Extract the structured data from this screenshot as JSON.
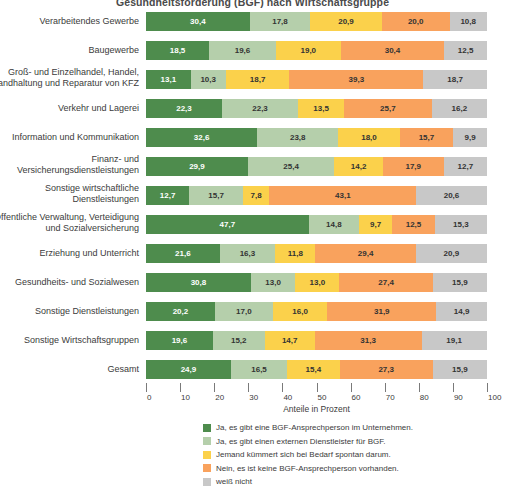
{
  "chart_data": {
    "type": "bar",
    "orientation": "horizontal",
    "stacked": true,
    "stack_total": 100,
    "title": "Gesundheitsförderung (BGF) nach Wirtschaftsgruppe",
    "xlabel": "Anteile in Prozent",
    "ylabel": "",
    "xlim": [
      0,
      100
    ],
    "xticks": [
      0,
      10,
      20,
      30,
      40,
      50,
      60,
      70,
      80,
      90,
      100
    ],
    "xticklabels": [
      "0",
      "10",
      "20",
      "30",
      "40",
      "50",
      "60",
      "70",
      "80",
      "90",
      "100"
    ],
    "grid": false,
    "legend_position": "bottom",
    "decimal_separator": ",",
    "colors": [
      "#4e8c4d",
      "#b5cfab",
      "#fbd14b",
      "#f9a25d",
      "#c8c8c8"
    ],
    "legend": [
      "Ja, es gibt eine BGF-Ansprechperson im Unternehmen.",
      "Ja, es gibt einen externen Dienstleister für BGF.",
      "Jemand kümmert sich bei Bedarf spontan darum.",
      "Nein, es ist keine BGF-Ansprechperson vorhanden.",
      "weiß nicht"
    ],
    "categories": [
      "Verarbeitendes Gewerbe",
      "Baugewerbe",
      "Groß- und Einzelhandel, Handel,\nInstandhaltung und Reparatur von KFZ",
      "Verkehr und Lagerei",
      "Information und Kommunikation",
      "Finanz- und\nVersicherungsdienstleistungen",
      "Sonstige wirtschaftliche\nDienstleistungen",
      "Öffentliche Verwaltung, Verteidigung\nund Sozialversicherung",
      "Erziehung und Unterricht",
      "Gesundheits- und Sozialwesen",
      "Sonstige Dienstleistungen",
      "Sonstige Wirtschaftsgruppen",
      "Gesamt"
    ],
    "series": [
      {
        "name": "Ja, es gibt eine BGF-Ansprechperson im Unternehmen.",
        "color": "#4e8c4d",
        "values": [
          30.4,
          18.5,
          13.1,
          22.3,
          32.6,
          29.9,
          12.7,
          47.7,
          21.6,
          30.8,
          20.2,
          19.6,
          24.9
        ],
        "labels": [
          "30,4",
          "18,5",
          "13,1",
          "22,3",
          "32,6",
          "29,9",
          "12,7",
          "47,7",
          "21,6",
          "30,8",
          "20,2",
          "19,6",
          "24,9"
        ]
      },
      {
        "name": "Ja, es gibt einen externen Dienstleister für BGF.",
        "color": "#b5cfab",
        "values": [
          17.8,
          19.6,
          10.3,
          22.3,
          23.8,
          25.4,
          15.7,
          14.8,
          16.3,
          13.0,
          17.0,
          15.2,
          16.5
        ],
        "labels": [
          "17,8",
          "19,6",
          "10,3",
          "22,3",
          "23,8",
          "25,4",
          "15,7",
          "14,8",
          "16,3",
          "13,0",
          "17,0",
          "15,2",
          "16,5"
        ]
      },
      {
        "name": "Jemand kümmert sich bei Bedarf spontan darum.",
        "color": "#fbd14b",
        "values": [
          20.9,
          19.0,
          18.7,
          13.5,
          18.0,
          14.2,
          7.8,
          9.7,
          11.8,
          13.0,
          16.0,
          14.7,
          15.4
        ],
        "labels": [
          "20,9",
          "19,0",
          "18,7",
          "13,5",
          "18,0",
          "14,2",
          "7,8",
          "9,7",
          "11,8",
          "13,0",
          "16,0",
          "14,7",
          "15,4"
        ]
      },
      {
        "name": "Nein, es ist keine BGF-Ansprechperson vorhanden.",
        "color": "#f9a25d",
        "values": [
          20.0,
          30.4,
          39.3,
          25.7,
          15.7,
          17.9,
          43.1,
          12.5,
          29.4,
          27.4,
          31.9,
          31.3,
          27.3
        ],
        "labels": [
          "20,0",
          "30,4",
          "39,3",
          "25,7",
          "15,7",
          "17,9",
          "43,1",
          "12,5",
          "29,4",
          "27,4",
          "31,9",
          "31,3",
          "27,3"
        ]
      },
      {
        "name": "weiß nicht",
        "color": "#c8c8c8",
        "values": [
          10.8,
          12.5,
          18.7,
          16.2,
          9.9,
          12.7,
          20.6,
          15.3,
          20.9,
          15.9,
          14.9,
          19.1,
          15.9
        ],
        "labels": [
          "10,8",
          "12,5",
          "18,7",
          "16,2",
          "9,9",
          "12,7",
          "20,6",
          "15,3",
          "20,9",
          "15,9",
          "14,9",
          "19,1",
          "15,9"
        ]
      }
    ]
  }
}
